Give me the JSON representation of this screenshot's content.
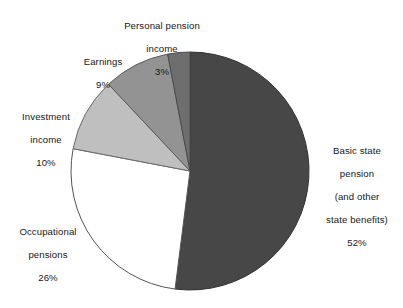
{
  "chart_data": {
    "type": "pie",
    "title": "",
    "subtitle": "",
    "xlabel": "",
    "ylabel": "",
    "legend_position": "none",
    "grid": false,
    "units": "percent",
    "total": 100,
    "center": {
      "x": 190,
      "y": 171
    },
    "radius": 119,
    "start_angle_deg": 0,
    "direction": "clockwise",
    "categories": [
      "Basic state pension (and other state benefits)",
      "Occupational pensions",
      "Investment income",
      "Earnings",
      "Personal pension income"
    ],
    "values": [
      52,
      26,
      10,
      9,
      3
    ],
    "slices": [
      {
        "name": "basic-state-pension",
        "label_lines": [
          "Basic state",
          "pension",
          "(and other",
          "state benefits)"
        ],
        "value": 52,
        "value_text": "52%",
        "color": "#474747",
        "stroke": "#333333",
        "start_deg": 0,
        "end_deg": 187.2
      },
      {
        "name": "occupational-pensions",
        "label_lines": [
          "Occupational",
          "pensions"
        ],
        "value": 26,
        "value_text": "26%",
        "color": "#ffffff",
        "stroke": "#555555",
        "start_deg": 187.2,
        "end_deg": 280.8
      },
      {
        "name": "investment-income",
        "label_lines": [
          "Investment",
          "income"
        ],
        "value": 10,
        "value_text": "10%",
        "color": "#bfbfbf",
        "stroke": "#6b6b6b",
        "start_deg": 280.8,
        "end_deg": 316.8
      },
      {
        "name": "earnings",
        "label_lines": [
          "Earnings"
        ],
        "value": 9,
        "value_text": "9%",
        "color": "#939393",
        "stroke": "#5c5c5c",
        "start_deg": 316.8,
        "end_deg": 349.2
      },
      {
        "name": "personal-pension-income",
        "label_lines": [
          "Personal pension",
          "income"
        ],
        "value": 3,
        "value_text": "3%",
        "color": "#6e6e6e",
        "stroke": "#4a4a4a",
        "start_deg": 349.2,
        "end_deg": 360
      }
    ],
    "colors": {
      "background": "#ffffff",
      "text": "#181818",
      "basic_state_pension": "#474747",
      "occupational_pensions": "#ffffff",
      "investment_income": "#bfbfbf",
      "earnings": "#939393",
      "personal_pension_income": "#6e6e6e"
    }
  },
  "labels": {
    "basic_state_pension": {
      "line1": "Basic state",
      "line2": "pension",
      "line3": "(and other",
      "line4": "state benefits)",
      "percent": "52%"
    },
    "occupational_pensions": {
      "line1": "Occupational",
      "line2": "pensions",
      "percent": "26%"
    },
    "investment_income": {
      "line1": "Investment",
      "line2": "income",
      "percent": "10%"
    },
    "earnings": {
      "line1": "Earnings",
      "percent": "9%"
    },
    "personal_pension_income": {
      "line1": "Personal pension",
      "line2": "income",
      "percent": "3%"
    }
  }
}
